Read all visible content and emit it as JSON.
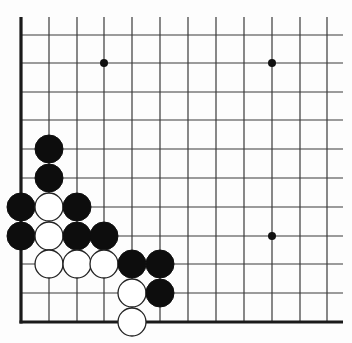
{
  "board": {
    "title": "Go board diagram (lower-left corner)",
    "colors": {
      "background": "#fdfdfd",
      "line": "#3a3a3a",
      "edge": "#1a1a1a",
      "black_stone": "#0d0d0d",
      "white_stone": "#ffffff"
    },
    "grid": {
      "columns_x": [
        21,
        49,
        77,
        104,
        132,
        160,
        188,
        216,
        244,
        272,
        300,
        327
      ],
      "rows_y": [
        35,
        63,
        92,
        120,
        149,
        178,
        207,
        236,
        264,
        293,
        322
      ],
      "line_top_y": 17,
      "line_right_x": 343,
      "left_edge_x": 21,
      "bottom_edge_y": 322
    },
    "edges": [
      "left",
      "bottom"
    ],
    "stone_radius": 14,
    "star_point_radius": 4,
    "star_points": [
      {
        "x": 104,
        "y": 63
      },
      {
        "x": 272,
        "y": 63
      },
      {
        "x": 272,
        "y": 236
      }
    ],
    "stones": [
      {
        "color": "black",
        "x": 49,
        "y": 149
      },
      {
        "color": "black",
        "x": 49,
        "y": 178
      },
      {
        "color": "black",
        "x": 21,
        "y": 207
      },
      {
        "color": "white",
        "x": 49,
        "y": 207
      },
      {
        "color": "black",
        "x": 77,
        "y": 207
      },
      {
        "color": "black",
        "x": 21,
        "y": 236
      },
      {
        "color": "white",
        "x": 49,
        "y": 236
      },
      {
        "color": "black",
        "x": 77,
        "y": 236
      },
      {
        "color": "black",
        "x": 104,
        "y": 236
      },
      {
        "color": "white",
        "x": 49,
        "y": 264
      },
      {
        "color": "white",
        "x": 77,
        "y": 264
      },
      {
        "color": "white",
        "x": 104,
        "y": 264
      },
      {
        "color": "black",
        "x": 132,
        "y": 264
      },
      {
        "color": "black",
        "x": 160,
        "y": 264
      },
      {
        "color": "white",
        "x": 132,
        "y": 293
      },
      {
        "color": "black",
        "x": 160,
        "y": 293
      },
      {
        "color": "white",
        "x": 132,
        "y": 322
      }
    ]
  }
}
